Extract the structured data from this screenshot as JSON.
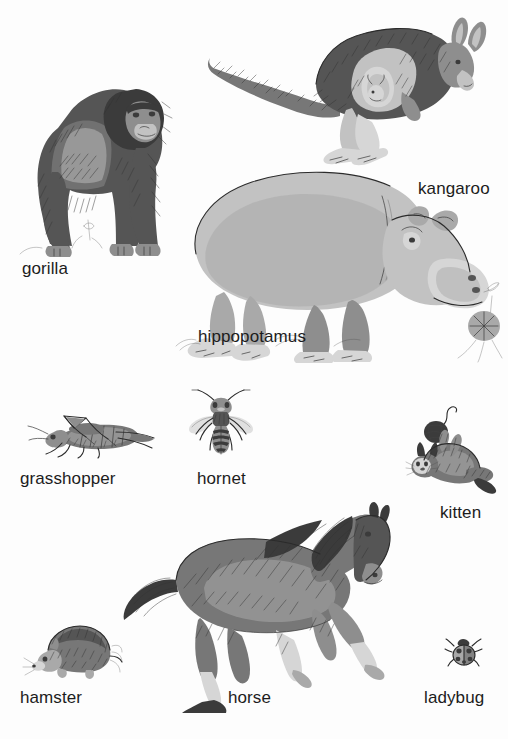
{
  "page": {
    "background_color": "#fdfdfd",
    "width": 508,
    "height": 739,
    "kind": "illustrated-animal-vocabulary-plate",
    "style": "grayscale pen-and-ink drawings with gray wash"
  },
  "palette": {
    "text_color": "#1c1c1c",
    "ink": "#2b2b2b",
    "wash_dark": "#555555",
    "wash_mid": "#8e8e8e",
    "wash_light": "#c2c2c2"
  },
  "figures": [
    {
      "id": "gorilla",
      "label": "gorilla",
      "icon": "gorilla-illustration",
      "label_x": 22,
      "label_y": 260,
      "fig_x": 12,
      "fig_y": 68,
      "fig_w": 168,
      "fig_h": 190,
      "description": "silverback gorilla standing on knuckles facing right"
    },
    {
      "id": "kangaroo",
      "label": "kangaroo",
      "icon": "kangaroo-illustration",
      "label_x": 418,
      "label_y": 180,
      "fig_x": 206,
      "fig_y": 14,
      "fig_w": 292,
      "fig_h": 152,
      "description": "kangaroo with joey in pouch facing right"
    },
    {
      "id": "hippopotamus",
      "label": "hippopotamus",
      "icon": "hippopotamus-illustration",
      "label_x": 198,
      "label_y": 328,
      "fig_x": 176,
      "fig_y": 168,
      "fig_w": 324,
      "fig_h": 196,
      "description": "hippopotamus facing right chewing a flower"
    },
    {
      "id": "grasshopper",
      "label": "grasshopper",
      "icon": "grasshopper-illustration",
      "label_x": 20,
      "label_y": 470,
      "fig_x": 26,
      "fig_y": 410,
      "fig_w": 130,
      "fig_h": 50,
      "description": "grasshopper in side view facing left"
    },
    {
      "id": "hornet",
      "label": "hornet",
      "icon": "hornet-illustration",
      "label_x": 197,
      "label_y": 470,
      "fig_x": 186,
      "fig_y": 388,
      "fig_w": 70,
      "fig_h": 70,
      "description": "hornet seen from above with wings spread"
    },
    {
      "id": "kitten",
      "label": "kitten",
      "icon": "kitten-illustration",
      "label_x": 440,
      "label_y": 504,
      "fig_x": 406,
      "fig_y": 404,
      "fig_w": 92,
      "fig_h": 92,
      "description": "kitten lying on its back playing with a ball of yarn"
    },
    {
      "id": "hamster",
      "label": "hamster",
      "icon": "hamster-illustration",
      "label_x": 20,
      "label_y": 689,
      "fig_x": 32,
      "fig_y": 618,
      "fig_w": 90,
      "fig_h": 62,
      "description": "hamster facing left"
    },
    {
      "id": "horse",
      "label": "horse",
      "icon": "horse-illustration",
      "label_x": 228,
      "label_y": 689,
      "fig_x": 116,
      "fig_y": 502,
      "fig_w": 282,
      "fig_h": 212,
      "description": "galloping horse facing right"
    },
    {
      "id": "ladybug",
      "label": "ladybug",
      "icon": "ladybug-illustration",
      "label_x": 424,
      "label_y": 689,
      "fig_x": 446,
      "fig_y": 636,
      "fig_w": 36,
      "fig_h": 34,
      "description": "ladybug seen from above"
    }
  ]
}
